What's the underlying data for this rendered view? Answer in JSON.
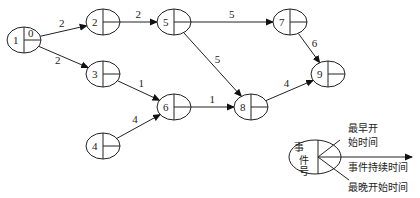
{
  "diagram": {
    "type": "activity-on-arrow network",
    "nodes": [
      {
        "id": "1",
        "x": 24,
        "y": 40,
        "value": "0"
      },
      {
        "id": "2",
        "x": 103,
        "y": 22,
        "value": ""
      },
      {
        "id": "3",
        "x": 103,
        "y": 74,
        "value": ""
      },
      {
        "id": "4",
        "x": 103,
        "y": 146,
        "value": ""
      },
      {
        "id": "5",
        "x": 174,
        "y": 22,
        "value": ""
      },
      {
        "id": "6",
        "x": 174,
        "y": 107,
        "value": ""
      },
      {
        "id": "7",
        "x": 290,
        "y": 22,
        "value": ""
      },
      {
        "id": "8",
        "x": 251,
        "y": 107,
        "value": ""
      },
      {
        "id": "9",
        "x": 328,
        "y": 74,
        "value": ""
      }
    ],
    "edges": [
      {
        "from": "1",
        "to": "2",
        "duration": "2"
      },
      {
        "from": "1",
        "to": "3",
        "duration": "2"
      },
      {
        "from": "2",
        "to": "5",
        "duration": "2"
      },
      {
        "from": "3",
        "to": "6",
        "duration": "1"
      },
      {
        "from": "4",
        "to": "6",
        "duration": "4"
      },
      {
        "from": "5",
        "to": "7",
        "duration": "5"
      },
      {
        "from": "5",
        "to": "8",
        "duration": "5"
      },
      {
        "from": "6",
        "to": "8",
        "duration": "1"
      },
      {
        "from": "7",
        "to": "9",
        "duration": "6"
      },
      {
        "from": "8",
        "to": "9",
        "duration": "4"
      }
    ]
  },
  "legend": {
    "event_number": "事件号",
    "event_chars": [
      "事",
      "件",
      "号"
    ],
    "earliest_start_line1": "最早开",
    "earliest_start_line2": "始时间",
    "duration": "事件持续时间",
    "latest_start": "最晚开始时间"
  }
}
